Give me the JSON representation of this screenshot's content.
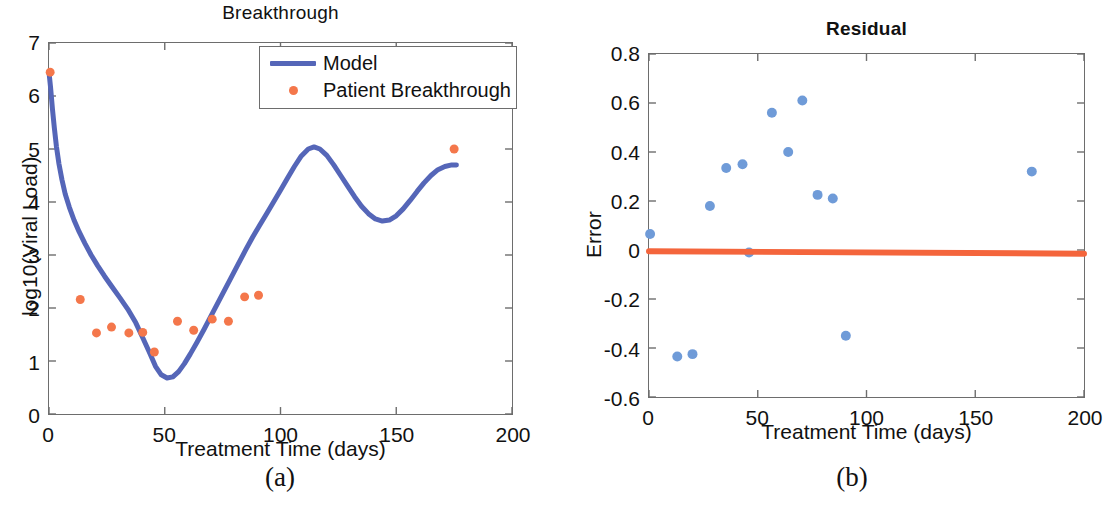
{
  "figure": {
    "panels": [
      {
        "id": "a",
        "subcaption": "(a)",
        "title": "Breakthrough",
        "xlabel": "Treatment Time (days)",
        "ylabel": "log10(Viral Load)"
      },
      {
        "id": "b",
        "subcaption": "(b)",
        "title": "Residual",
        "xlabel": "Treatment Time (days)",
        "ylabel": "Error"
      }
    ]
  },
  "colors": {
    "model_blue": "#5566b8",
    "patient_orange": "#f4774b",
    "residual_blue": "#6f9bd8",
    "zero_line_orange": "#f4653c",
    "axis_gray": "#6d6d6d",
    "text": "#111111",
    "background": "#ffffff"
  },
  "legend": {
    "entries": [
      {
        "label": "Model",
        "marker": "line",
        "color": "#5566b8"
      },
      {
        "label": "Patient Breakthrough",
        "marker": "dot",
        "color": "#f4774b"
      }
    ]
  },
  "chart_data": [
    {
      "type": "line",
      "panel": "a",
      "title": "Breakthrough",
      "xlabel": "Treatment Time (days)",
      "ylabel": "log10(Viral Load)",
      "xlim": [
        0,
        200
      ],
      "ylim": [
        0,
        7
      ],
      "xticks": [
        0,
        50,
        100,
        150,
        200
      ],
      "yticks": [
        0,
        1,
        2,
        3,
        4,
        5,
        6,
        7
      ],
      "xtick_labels": [
        "0",
        "50",
        "100",
        "150",
        "200"
      ],
      "ytick_labels": [
        "0",
        "1",
        "2",
        "3",
        "4",
        "5",
        "6",
        "7"
      ],
      "grid": false,
      "legend_position": "top-right-inside",
      "series": [
        {
          "name": "Model",
          "type": "line",
          "color": "#5566b8",
          "linewidth": 5,
          "points": [
            [
              0.0,
              6.45
            ],
            [
              0.7,
              6.15
            ],
            [
              1.5,
              5.75
            ],
            [
              2.3,
              5.4
            ],
            [
              3.2,
              5.05
            ],
            [
              4.3,
              4.72
            ],
            [
              5.6,
              4.42
            ],
            [
              7.0,
              4.15
            ],
            [
              8.8,
              3.9
            ],
            [
              10.8,
              3.66
            ],
            [
              13.0,
              3.44
            ],
            [
              15.5,
              3.22
            ],
            [
              18.2,
              3.0
            ],
            [
              21.0,
              2.8
            ],
            [
              24.0,
              2.6
            ],
            [
              27.2,
              2.4
            ],
            [
              30.5,
              2.2
            ],
            [
              34.0,
              1.98
            ],
            [
              37.5,
              1.72
            ],
            [
              40.5,
              1.44
            ],
            [
              43.5,
              1.15
            ],
            [
              46.0,
              0.9
            ],
            [
              48.5,
              0.74
            ],
            [
              51.0,
              0.68
            ],
            [
              53.5,
              0.7
            ],
            [
              56.0,
              0.8
            ],
            [
              58.5,
              0.95
            ],
            [
              61.0,
              1.13
            ],
            [
              64.0,
              1.36
            ],
            [
              67.0,
              1.6
            ],
            [
              70.0,
              1.85
            ],
            [
              73.0,
              2.1
            ],
            [
              76.0,
              2.35
            ],
            [
              79.0,
              2.6
            ],
            [
              82.0,
              2.85
            ],
            [
              85.0,
              3.1
            ],
            [
              88.0,
              3.34
            ],
            [
              91.0,
              3.56
            ],
            [
              94.0,
              3.78
            ],
            [
              97.0,
              4.0
            ],
            [
              100.0,
              4.22
            ],
            [
              103.0,
              4.45
            ],
            [
              106.0,
              4.67
            ],
            [
              109.0,
              4.87
            ],
            [
              112.0,
              5.0
            ],
            [
              114.5,
              5.04
            ],
            [
              117.0,
              5.0
            ],
            [
              120.0,
              4.88
            ],
            [
              123.0,
              4.7
            ],
            [
              126.0,
              4.5
            ],
            [
              129.0,
              4.3
            ],
            [
              132.0,
              4.1
            ],
            [
              135.0,
              3.92
            ],
            [
              138.0,
              3.78
            ],
            [
              141.0,
              3.68
            ],
            [
              144.0,
              3.64
            ],
            [
              147.0,
              3.66
            ],
            [
              150.0,
              3.74
            ],
            [
              153.0,
              3.87
            ],
            [
              156.0,
              4.03
            ],
            [
              159.0,
              4.2
            ],
            [
              162.0,
              4.36
            ],
            [
              165.0,
              4.5
            ],
            [
              168.0,
              4.61
            ],
            [
              171.0,
              4.67
            ],
            [
              174.0,
              4.7
            ],
            [
              176.0,
              4.7
            ]
          ]
        },
        {
          "name": "Patient Breakthrough",
          "type": "scatter",
          "color": "#f4774b",
          "marker": "circle",
          "markersize": 9,
          "points": [
            [
              0.5,
              6.45
            ],
            [
              13.5,
              2.16
            ],
            [
              20.5,
              1.53
            ],
            [
              27.0,
              1.64
            ],
            [
              34.5,
              1.53
            ],
            [
              40.5,
              1.54
            ],
            [
              45.5,
              1.17
            ],
            [
              55.5,
              1.75
            ],
            [
              62.5,
              1.58
            ],
            [
              70.5,
              1.79
            ],
            [
              77.5,
              1.75
            ],
            [
              84.5,
              2.21
            ],
            [
              90.5,
              2.24
            ],
            [
              175.0,
              5.0
            ]
          ]
        }
      ]
    },
    {
      "type": "scatter",
      "panel": "b",
      "title": "Residual",
      "xlabel": "Treatment Time (days)",
      "ylabel": "Error",
      "xlim": [
        0,
        200
      ],
      "ylim": [
        -0.6,
        0.8
      ],
      "xticks": [
        0,
        50,
        100,
        150,
        200
      ],
      "yticks": [
        -0.6,
        -0.4,
        -0.2,
        0,
        0.2,
        0.4,
        0.6,
        0.8
      ],
      "xtick_labels": [
        "0",
        "50",
        "100",
        "150",
        "200"
      ],
      "ytick_labels": [
        "-0.6",
        "-0.4",
        "-0.2",
        "0",
        "0.2",
        "0.4",
        "0.6",
        "0.8"
      ],
      "grid": false,
      "legend_position": "none",
      "series": [
        {
          "name": "Error",
          "type": "scatter",
          "color": "#6f9bd8",
          "marker": "circle",
          "markersize": 10,
          "points": [
            [
              0.5,
              0.065
            ],
            [
              13.0,
              -0.435
            ],
            [
              20.0,
              -0.425
            ],
            [
              28.0,
              0.18
            ],
            [
              35.5,
              0.335
            ],
            [
              43.0,
              0.35
            ],
            [
              46.0,
              -0.01
            ],
            [
              56.5,
              0.56
            ],
            [
              64.0,
              0.4
            ],
            [
              70.5,
              0.61
            ],
            [
              77.5,
              0.225
            ],
            [
              84.5,
              0.21
            ],
            [
              90.5,
              -0.35
            ],
            [
              176.0,
              0.32
            ]
          ]
        },
        {
          "name": "Zero reference line",
          "type": "line",
          "color": "#f4653c",
          "linewidth": 6,
          "points": [
            [
              0,
              -0.005
            ],
            [
              200,
              -0.015
            ]
          ]
        }
      ]
    }
  ]
}
